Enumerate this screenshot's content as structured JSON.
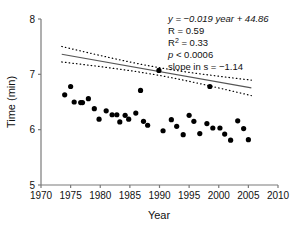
{
  "chart_data": {
    "type": "scatter",
    "title": "",
    "xlabel": "Year",
    "ylabel": "Time (min)",
    "xlim": [
      1970,
      2010
    ],
    "ylim": [
      5,
      8
    ],
    "xticks": [
      1970,
      1975,
      1980,
      1985,
      1990,
      1995,
      2000,
      2005,
      2010
    ],
    "yticks": [
      5,
      6,
      7,
      8
    ],
    "grid": false,
    "legend": null,
    "point_color": "#000000",
    "line_color": "#555555",
    "band_color": "#000000",
    "points": [
      {
        "x": 1974.0,
        "y": 6.63
      },
      {
        "x": 1975.0,
        "y": 6.78
      },
      {
        "x": 1975.6,
        "y": 6.5
      },
      {
        "x": 1976.7,
        "y": 6.49
      },
      {
        "x": 1977.0,
        "y": 6.49
      },
      {
        "x": 1978.0,
        "y": 6.56
      },
      {
        "x": 1979.0,
        "y": 6.38
      },
      {
        "x": 1979.8,
        "y": 6.19
      },
      {
        "x": 1981.0,
        "y": 6.34
      },
      {
        "x": 1982.0,
        "y": 6.27
      },
      {
        "x": 1982.8,
        "y": 6.27
      },
      {
        "x": 1983.3,
        "y": 6.14
      },
      {
        "x": 1984.2,
        "y": 6.26
      },
      {
        "x": 1984.8,
        "y": 6.19
      },
      {
        "x": 1986.0,
        "y": 6.3
      },
      {
        "x": 1986.8,
        "y": 6.71
      },
      {
        "x": 1987.3,
        "y": 6.15
      },
      {
        "x": 1988.0,
        "y": 6.08
      },
      {
        "x": 1989.9,
        "y": 7.07
      },
      {
        "x": 1990.6,
        "y": 5.98
      },
      {
        "x": 1992.0,
        "y": 6.18
      },
      {
        "x": 1992.9,
        "y": 6.06
      },
      {
        "x": 1994.0,
        "y": 5.91
      },
      {
        "x": 1995.0,
        "y": 6.26
      },
      {
        "x": 1995.8,
        "y": 6.15
      },
      {
        "x": 1996.8,
        "y": 5.93
      },
      {
        "x": 1998.0,
        "y": 6.11
      },
      {
        "x": 1998.5,
        "y": 6.78
      },
      {
        "x": 1999.0,
        "y": 6.03
      },
      {
        "x": 2000.2,
        "y": 6.03
      },
      {
        "x": 2001.0,
        "y": 5.92
      },
      {
        "x": 2002.0,
        "y": 5.81
      },
      {
        "x": 2003.2,
        "y": 6.16
      },
      {
        "x": 2004.2,
        "y": 6.02
      },
      {
        "x": 2005.0,
        "y": 5.82
      }
    ],
    "regression": {
      "slope": -0.019,
      "intercept": 44.86,
      "x_start": 1973.5,
      "x_end": 2005.5
    },
    "confidence_band": {
      "style": "dotted",
      "half_width_center": 0.07,
      "half_width_edge": 0.14
    }
  },
  "annotations": {
    "equation": "y = −0.019 year + 44.86",
    "correlation": "R = 0.59",
    "r_squared_base": "R",
    "r_squared_sup": "2",
    "r_squared_value": " = 0.33",
    "p_value_symbol": "p",
    "p_value_rest": " < 0.0006",
    "slope_seconds": "slope in s = −1.14"
  }
}
